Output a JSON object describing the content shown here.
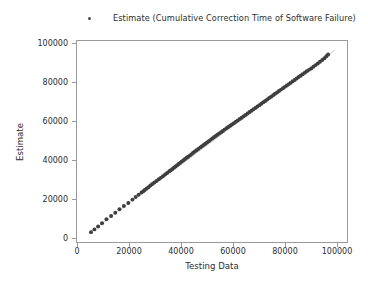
{
  "chart_data": {
    "type": "scatter",
    "title": "",
    "xlabel": "Testing Data",
    "ylabel": "Estimate",
    "xlim": [
      -5000,
      105000
    ],
    "ylim": [
      -5000,
      105000
    ],
    "xticks": [
      0,
      20000,
      40000,
      60000,
      80000,
      100000
    ],
    "yticks": [
      0,
      20000,
      40000,
      60000,
      80000,
      100000
    ],
    "xtick_labels": [
      "0",
      "20000",
      "40000",
      "60000",
      "80000",
      "100000"
    ],
    "ytick_labels": [
      "0",
      "20000",
      "40000",
      "60000",
      "80000",
      "100000"
    ],
    "grid": false,
    "legend_position": "upper center outside",
    "legend": [
      {
        "label": "Estimate (Cumulative Correction Time of Software Failure)",
        "marker": "dot",
        "color": "#4c4c4c"
      }
    ],
    "reference_line": {
      "label": "",
      "color": "#b9b9b9",
      "from": [
        0,
        0
      ],
      "to": [
        100000,
        100000
      ],
      "width": 0.7
    },
    "series": [
      {
        "name": "Estimate (Cumulative Correction Time of Software Failure)",
        "marker": "dot",
        "color": "#3f3f3f",
        "size": 2.0,
        "points": [
          [
            700,
            400
          ],
          [
            2100,
            1900
          ],
          [
            3600,
            3500
          ],
          [
            5200,
            5300
          ],
          [
            7000,
            7400
          ],
          [
            8900,
            9200
          ],
          [
            10600,
            11000
          ],
          [
            12300,
            12900
          ],
          [
            14100,
            14700
          ],
          [
            15900,
            16400
          ],
          [
            17600,
            18200
          ],
          [
            18900,
            19600
          ],
          [
            20100,
            20900
          ],
          [
            21300,
            22100
          ],
          [
            22000,
            22800
          ],
          [
            22600,
            23500
          ],
          [
            23300,
            24200
          ],
          [
            24100,
            25000
          ],
          [
            24900,
            25900
          ],
          [
            25700,
            26700
          ],
          [
            26500,
            27600
          ],
          [
            27400,
            28400
          ],
          [
            28300,
            29300
          ],
          [
            29100,
            30100
          ],
          [
            30000,
            31000
          ],
          [
            30900,
            31900
          ],
          [
            31700,
            32800
          ],
          [
            32600,
            33700
          ],
          [
            33200,
            34300
          ],
          [
            33900,
            35000
          ],
          [
            34500,
            35700
          ],
          [
            35100,
            36300
          ],
          [
            35800,
            37000
          ],
          [
            36400,
            37700
          ],
          [
            37100,
            38400
          ],
          [
            37700,
            39000
          ],
          [
            38400,
            39700
          ],
          [
            39000,
            40400
          ],
          [
            39700,
            41100
          ],
          [
            40300,
            41700
          ],
          [
            41000,
            42400
          ],
          [
            41700,
            43100
          ],
          [
            42300,
            43800
          ],
          [
            43000,
            44500
          ],
          [
            43700,
            45200
          ],
          [
            44400,
            45900
          ],
          [
            45200,
            46700
          ],
          [
            45900,
            47400
          ],
          [
            46600,
            48100
          ],
          [
            47300,
            48800
          ],
          [
            48000,
            49500
          ],
          [
            48700,
            50200
          ],
          [
            49400,
            50900
          ],
          [
            50100,
            51600
          ],
          [
            50800,
            52300
          ],
          [
            51500,
            53000
          ],
          [
            52200,
            53700
          ],
          [
            52900,
            54400
          ],
          [
            53700,
            55100
          ],
          [
            54400,
            55800
          ],
          [
            55100,
            56500
          ],
          [
            55900,
            57200
          ],
          [
            56600,
            57900
          ],
          [
            57400,
            58600
          ],
          [
            58100,
            59300
          ],
          [
            58900,
            60000
          ],
          [
            59700,
            60800
          ],
          [
            60500,
            61500
          ],
          [
            61300,
            62300
          ],
          [
            62100,
            63000
          ],
          [
            62900,
            63800
          ],
          [
            63700,
            64500
          ],
          [
            64500,
            65300
          ],
          [
            65300,
            66100
          ],
          [
            66100,
            66800
          ],
          [
            66900,
            67600
          ],
          [
            67700,
            68400
          ],
          [
            68500,
            69100
          ],
          [
            69300,
            69900
          ],
          [
            70100,
            70700
          ],
          [
            70900,
            71500
          ],
          [
            71700,
            72200
          ],
          [
            72500,
            73000
          ],
          [
            73300,
            73800
          ],
          [
            74100,
            74500
          ],
          [
            74900,
            75300
          ],
          [
            75700,
            76100
          ],
          [
            76500,
            76800
          ],
          [
            77300,
            77600
          ],
          [
            78100,
            78400
          ],
          [
            78900,
            79100
          ],
          [
            79700,
            79900
          ],
          [
            80500,
            80700
          ],
          [
            81300,
            81400
          ],
          [
            82100,
            82200
          ],
          [
            82900,
            83000
          ],
          [
            83700,
            83700
          ],
          [
            84500,
            84500
          ],
          [
            85300,
            85300
          ],
          [
            86100,
            86000
          ],
          [
            86900,
            86800
          ],
          [
            87800,
            87600
          ],
          [
            88600,
            88400
          ],
          [
            89500,
            89200
          ],
          [
            90400,
            90000
          ],
          [
            91300,
            90900
          ],
          [
            92200,
            91800
          ],
          [
            93100,
            92700
          ],
          [
            94000,
            93600
          ],
          [
            94900,
            94600
          ],
          [
            95800,
            95600
          ],
          [
            96600,
            96600
          ],
          [
            97300,
            97600
          ]
        ]
      }
    ]
  }
}
